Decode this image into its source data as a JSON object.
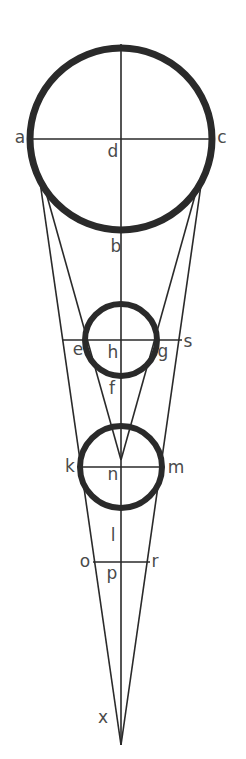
{
  "figure": {
    "width": 246,
    "height": 759,
    "colors": {
      "stroke": "#2a2a2a",
      "label": "#4a4a4a",
      "background": "#ffffff"
    },
    "circles": [
      {
        "name": "large-circle",
        "cx": 121,
        "cy": 139,
        "r": 91,
        "stroke_width": 7
      },
      {
        "name": "middle-circle",
        "cx": 121,
        "cy": 340,
        "r": 36,
        "stroke_width": 6
      },
      {
        "name": "lower-circle",
        "cx": 121,
        "cy": 467,
        "r": 41,
        "stroke_width": 6
      }
    ],
    "lines": [
      {
        "name": "vertical-axis",
        "x1": 121,
        "y1": 44,
        "x2": 121,
        "y2": 745
      },
      {
        "name": "diameter-ac",
        "x1": 32,
        "y1": 139,
        "x2": 210,
        "y2": 139
      },
      {
        "name": "chord-es",
        "x1": 62,
        "y1": 340,
        "x2": 182,
        "y2": 340
      },
      {
        "name": "chord-km",
        "x1": 80,
        "y1": 467,
        "x2": 163,
        "y2": 467
      },
      {
        "name": "chord-or",
        "x1": 93,
        "y1": 562,
        "x2": 150,
        "y2": 562
      },
      {
        "name": "outer-left-ray",
        "x1": 40,
        "y1": 182,
        "x2": 121,
        "y2": 745
      },
      {
        "name": "outer-right-ray",
        "x1": 201,
        "y1": 185,
        "x2": 121,
        "y2": 745
      },
      {
        "name": "inner-left-ray",
        "x1": 47,
        "y1": 196,
        "x2": 121,
        "y2": 460
      },
      {
        "name": "inner-right-ray",
        "x1": 196,
        "y1": 192,
        "x2": 121,
        "y2": 460
      }
    ],
    "labels": [
      {
        "text": "a",
        "x": 20,
        "y": 137
      },
      {
        "text": "c",
        "x": 222,
        "y": 137
      },
      {
        "text": "d",
        "x": 113,
        "y": 151
      },
      {
        "text": "b",
        "x": 116,
        "y": 246
      },
      {
        "text": "e",
        "x": 78,
        "y": 349
      },
      {
        "text": "h",
        "x": 113,
        "y": 352
      },
      {
        "text": "g",
        "x": 163,
        "y": 351
      },
      {
        "text": "s",
        "x": 188,
        "y": 341
      },
      {
        "text": "f",
        "x": 112,
        "y": 388
      },
      {
        "text": "k",
        "x": 70,
        "y": 466
      },
      {
        "text": "n",
        "x": 113,
        "y": 474
      },
      {
        "text": "m",
        "x": 176,
        "y": 467
      },
      {
        "text": "l",
        "x": 113,
        "y": 535
      },
      {
        "text": "o",
        "x": 85,
        "y": 561
      },
      {
        "text": "p",
        "x": 112,
        "y": 573
      },
      {
        "text": "r",
        "x": 155,
        "y": 561
      },
      {
        "text": "x",
        "x": 103,
        "y": 717
      }
    ]
  }
}
